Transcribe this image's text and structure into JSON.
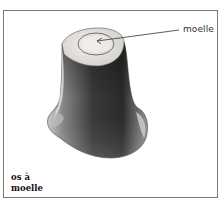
{
  "diagram": {
    "callout_label": "moelle",
    "caption_lines": [
      "os à",
      "moelle"
    ]
  },
  "colors": {
    "frame": "#7a7a7a",
    "bone_dark": "#2e2e2e",
    "bone_mid": "#6a6a6a",
    "bone_light": "#d8d8d8",
    "cut_surface": "#e8e6e2"
  }
}
